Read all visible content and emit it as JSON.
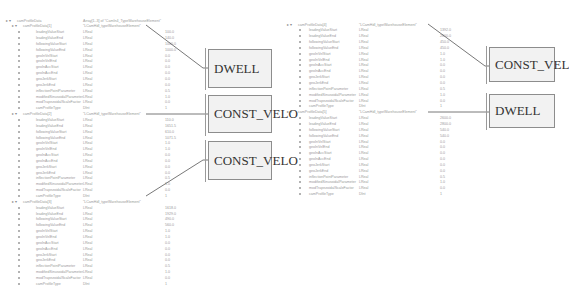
{
  "left_panel": {
    "root": {
      "name": "camProfileData",
      "type": "Array[1..3] of \"CamIn4_TypeWarehouseElement\""
    },
    "groups": [
      {
        "header": {
          "name": "camProfileData[1]",
          "value": "\"LCamHdl_typeWarehouseElement\""
        },
        "rows": [
          {
            "name": "leadingValueStart",
            "type": "LReal",
            "value": "100.0"
          },
          {
            "name": "leadingValueEnd",
            "type": "LReal",
            "value": "140.0"
          },
          {
            "name": "followingValueStart",
            "type": "LReal",
            "value": "1000.0"
          },
          {
            "name": "followingValueEnd",
            "type": "LReal",
            "value": "1000.0"
          },
          {
            "name": "geoInVelStart",
            "type": "LReal",
            "value": "0.0"
          },
          {
            "name": "geoInVelEnd",
            "type": "LReal",
            "value": "0.0"
          },
          {
            "name": "geoInAccStart",
            "type": "LReal",
            "value": "0.0"
          },
          {
            "name": "geoInAccEnd",
            "type": "LReal",
            "value": "0.0"
          },
          {
            "name": "geoJerkStart",
            "type": "LReal",
            "value": "0.0"
          },
          {
            "name": "geoJerkEnd",
            "type": "LReal",
            "value": "0.0"
          },
          {
            "name": "inflectionPointParameter",
            "type": "LReal",
            "value": "0.5"
          },
          {
            "name": "modifiedSinusoidalParameter",
            "type": "LReal",
            "value": "1.0"
          },
          {
            "name": "modTrapezoidalScaleFactor",
            "type": "LReal",
            "value": "0.0"
          },
          {
            "name": "camProfileType",
            "type": "DInt",
            "value": "1"
          }
        ]
      },
      {
        "header": {
          "name": "camProfileData[2]",
          "value": "\"LCamHdl_typeWarehouseElement\""
        },
        "rows": [
          {
            "name": "leadingValueStart",
            "type": "LReal",
            "value": "110.0"
          },
          {
            "name": "leadingValueEnd",
            "type": "LReal",
            "value": "1651.5"
          },
          {
            "name": "followingValueStart",
            "type": "LReal",
            "value": "610.0"
          },
          {
            "name": "followingValueEnd",
            "type": "LReal",
            "value": "1071.5"
          },
          {
            "name": "geoInVelStart",
            "type": "LReal",
            "value": "1.0"
          },
          {
            "name": "geoInVelEnd",
            "type": "LReal",
            "value": "1.0"
          },
          {
            "name": "geoInAccStart",
            "type": "LReal",
            "value": "0.0"
          },
          {
            "name": "geoInAccEnd",
            "type": "LReal",
            "value": "0.0"
          },
          {
            "name": "geoJerkStart",
            "type": "LReal",
            "value": "0.0"
          },
          {
            "name": "geoJerkEnd",
            "type": "LReal",
            "value": "0.0"
          },
          {
            "name": "inflectionPointParameter",
            "type": "LReal",
            "value": "0.5"
          },
          {
            "name": "modifiedSinusoidalParameter",
            "type": "LReal",
            "value": "1.0"
          },
          {
            "name": "modTrapezoidalScaleFactor",
            "type": "LReal",
            "value": "0.0"
          },
          {
            "name": "camProfileType",
            "type": "DInt",
            "value": "1"
          }
        ]
      },
      {
        "header": {
          "name": "camProfileData[3]",
          "value": "\"LCamHdl_typeWarehouseElement\""
        },
        "rows": [
          {
            "name": "leadingValueStart",
            "type": "LReal",
            "value": "1618.0"
          },
          {
            "name": "leadingValueEnd",
            "type": "LReal",
            "value": "1929.0"
          },
          {
            "name": "followingValueStart",
            "type": "LReal",
            "value": "490.0"
          },
          {
            "name": "followingValueEnd",
            "type": "LReal",
            "value": "560.0"
          },
          {
            "name": "geoInVelStart",
            "type": "LReal",
            "value": "1.0"
          },
          {
            "name": "geoInVelEnd",
            "type": "LReal",
            "value": "1.0"
          },
          {
            "name": "geoInAccStart",
            "type": "LReal",
            "value": "0.0"
          },
          {
            "name": "geoInAccEnd",
            "type": "LReal",
            "value": "0.0"
          },
          {
            "name": "geoJerkStart",
            "type": "LReal",
            "value": "0.0"
          },
          {
            "name": "geoJerkEnd",
            "type": "LReal",
            "value": "0.0"
          },
          {
            "name": "inflectionPointParameter",
            "type": "LReal",
            "value": "0.5"
          },
          {
            "name": "modifiedSinusoidalParameter",
            "type": "LReal",
            "value": "1.0"
          },
          {
            "name": "modTrapezoidalScaleFactor",
            "type": "LReal",
            "value": "0.0"
          },
          {
            "name": "camProfileType",
            "type": "DInt",
            "value": "1"
          }
        ]
      }
    ],
    "callouts": [
      "DWELL",
      "CONST_VELO",
      "CONST_VELO"
    ]
  },
  "right_panel": {
    "groups": [
      {
        "header": {
          "name": "camProfileData[4]",
          "value": "\"LCamHdl_typeWarehouseElement\""
        },
        "rows": [
          {
            "name": "leadingValueStart",
            "type": "LReal",
            "value": "1392.0"
          },
          {
            "name": "leadingValueEnd",
            "type": "LReal",
            "value": "2600.0"
          },
          {
            "name": "followingValueStart",
            "type": "LReal",
            "value": "450.0"
          },
          {
            "name": "followingValueEnd",
            "type": "LReal",
            "value": "450.0"
          },
          {
            "name": "geoInVelStart",
            "type": "LReal",
            "value": "1.0"
          },
          {
            "name": "geoInVelEnd",
            "type": "LReal",
            "value": "1.0"
          },
          {
            "name": "geoInAccStart",
            "type": "LReal",
            "value": "0.0"
          },
          {
            "name": "geoInAccEnd",
            "type": "LReal",
            "value": "0.0"
          },
          {
            "name": "geoJerkStart",
            "type": "LReal",
            "value": "0.0"
          },
          {
            "name": "geoJerkEnd",
            "type": "LReal",
            "value": "0.0"
          },
          {
            "name": "inflectionPointParameter",
            "type": "LReal",
            "value": "0.5"
          },
          {
            "name": "modifiedSinusoidalParameter",
            "type": "LReal",
            "value": "1.0"
          },
          {
            "name": "modTrapezoidalScaleFactor",
            "type": "LReal",
            "value": "0.0"
          },
          {
            "name": "camProfileType",
            "type": "DInt",
            "value": "1"
          }
        ]
      },
      {
        "header": {
          "name": "camProfileData[5]",
          "value": "\"LCamHdl_typeWarehouseElement\""
        },
        "rows": [
          {
            "name": "leadingValueStart",
            "type": "LReal",
            "value": "2600.0"
          },
          {
            "name": "leadingValueEnd",
            "type": "LReal",
            "value": "2800.0"
          },
          {
            "name": "followingValueStart",
            "type": "LReal",
            "value": "540.0"
          },
          {
            "name": "followingValueEnd",
            "type": "LReal",
            "value": "540.0"
          },
          {
            "name": "geoInVelStart",
            "type": "LReal",
            "value": "0.0"
          },
          {
            "name": "geoInVelEnd",
            "type": "LReal",
            "value": "0.0"
          },
          {
            "name": "geoInAccStart",
            "type": "LReal",
            "value": "0.0"
          },
          {
            "name": "geoInAccEnd",
            "type": "LReal",
            "value": "0.0"
          },
          {
            "name": "geoJerkStart",
            "type": "LReal",
            "value": "0.0"
          },
          {
            "name": "geoJerkEnd",
            "type": "LReal",
            "value": "0.0"
          },
          {
            "name": "inflectionPointParameter",
            "type": "LReal",
            "value": "0.5"
          },
          {
            "name": "modifiedSinusoidalParameter",
            "type": "LReal",
            "value": "1.0"
          },
          {
            "name": "modTrapezoidalScaleFactor",
            "type": "LReal",
            "value": "0.0"
          },
          {
            "name": "camProfileType",
            "type": "DInt",
            "value": "1"
          }
        ]
      }
    ],
    "callouts": [
      "CONST_VELO",
      "DWELL"
    ]
  }
}
